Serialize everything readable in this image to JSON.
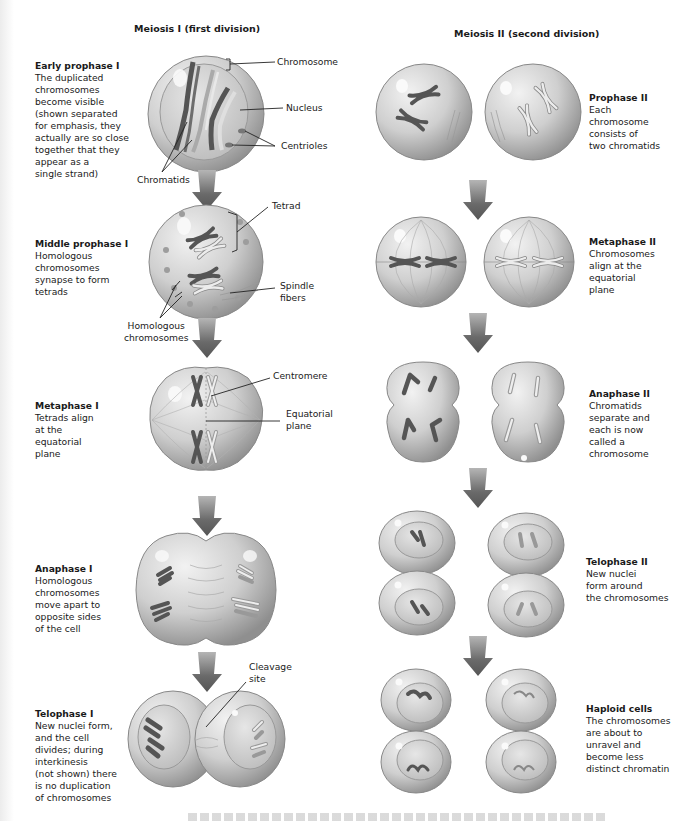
{
  "columns": {
    "meiosis1": {
      "title": "Meiosis I (first division)"
    },
    "meiosis2": {
      "title": "Meiosis II (second division)"
    }
  },
  "stages_meiosis1": [
    {
      "title": "Early prophase I",
      "body": "The duplicated\nchromosomes\nbecome visible\n(shown separated\nfor emphasis, they\nactually are so close\ntogether that they\nappear as a\nsingle strand)"
    },
    {
      "title": "Middle prophase I",
      "body": "Homologous\nchromosomes\nsynapse to form\ntetrads"
    },
    {
      "title": "Metaphase I",
      "body": "Tetrads align\nat the\nequatorial\nplane"
    },
    {
      "title": "Anaphase I",
      "body": "Homologous\nchromosomes\nmove apart to\nopposite sides\nof the cell"
    },
    {
      "title": "Telophase I",
      "body": "New nuclei form,\nand the cell\ndivides; during\ninterkinesis\n(not shown) there\nis no duplication\nof chromosomes"
    }
  ],
  "stages_meiosis2": [
    {
      "title": "Prophase II",
      "body": "Each\nchromosome\nconsists of\ntwo chromatids"
    },
    {
      "title": "Metaphase II",
      "body": "Chromosomes\nalign at the\nequatorial\nplane"
    },
    {
      "title": "Anaphase II",
      "body": "Chromatids\nseparate and\neach is now\ncalled a\nchromosome"
    },
    {
      "title": "Telophase II",
      "body": "New nuclei\nform around\nthe chromosomes"
    },
    {
      "title": "Haploid cells",
      "body": "The chromosomes\nare about to\nunravel and\nbecome less\ndistinct chromatin"
    }
  ],
  "callouts": {
    "chromosome": "Chromosome",
    "nucleus": "Nucleus",
    "centrioles": "Centrioles",
    "chromatids": "Chromatids",
    "tetrad": "Tetrad",
    "spindle_fibers": "Spindle\nfibers",
    "homologous_chromosomes": "Homologous\nchromosomes",
    "centromere": "Centromere",
    "equatorial_plane": "Equatorial\nplane",
    "cleavage_site": "Cleavage\nsite"
  },
  "colors": {
    "cell_fill": "#c9c9c9",
    "cell_edge": "#8e8e8e",
    "arrow": "#6e6e6e",
    "chromosome_dark": "#5a5a5a",
    "chromosome_light": "#e4e4e4"
  }
}
